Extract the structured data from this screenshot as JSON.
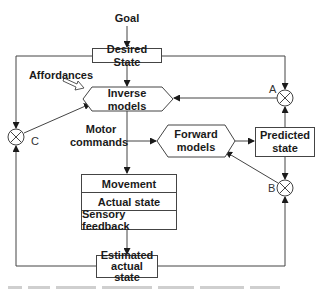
{
  "diagram": {
    "goal_label": "Goal",
    "nodes": {
      "desired_state": "Desired State",
      "inverse_models_line1": "Inverse",
      "inverse_models_line2": "models",
      "forward_models_line1": "Forward",
      "forward_models_line2": "models",
      "predicted_state_line1": "Predicted",
      "predicted_state_line2": "state",
      "movement": "Movement",
      "actual_state": "Actual state",
      "sensory_feedback": "Sensory feedback",
      "estimated_line1": "Estimated",
      "estimated_line2": "actual state"
    },
    "labels": {
      "affordances": "Affordances",
      "motor_commands_line1": "Motor",
      "motor_commands_line2": "commands"
    },
    "comparators": {
      "a": "A",
      "b": "B",
      "c": "C"
    },
    "edges": [
      {
        "from": "Goal",
        "to": "Desired State"
      },
      {
        "from": "Desired State",
        "to": "Inverse models"
      },
      {
        "from": "Desired State",
        "to": "A"
      },
      {
        "from": "Desired State",
        "to": "C"
      },
      {
        "from": "Affordances",
        "to": "Inverse models"
      },
      {
        "from": "A",
        "to": "Inverse models"
      },
      {
        "from": "C",
        "to": "Inverse models"
      },
      {
        "from": "Inverse models",
        "to": "Forward models",
        "label": "Motor commands"
      },
      {
        "from": "Inverse models",
        "to": "Movement"
      },
      {
        "from": "Forward models",
        "to": "Predicted state"
      },
      {
        "from": "Predicted state",
        "to": "A"
      },
      {
        "from": "Predicted state",
        "to": "B"
      },
      {
        "from": "B",
        "to": "Forward models"
      },
      {
        "from": "Sensory feedback",
        "to": "Estimated actual state"
      },
      {
        "from": "Estimated actual state",
        "to": "B"
      },
      {
        "from": "Estimated actual state",
        "to": "C"
      }
    ]
  }
}
